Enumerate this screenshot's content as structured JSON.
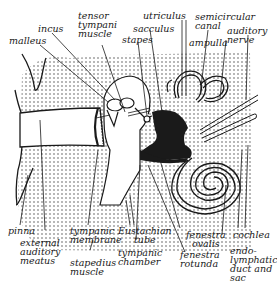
{
  "diagram": {
    "colors": {
      "ink": "#1a1a1a",
      "paper": "#ffffff",
      "stipple": "#3a3a3a"
    },
    "labels": {
      "malleus": "malleus",
      "incus": "incus",
      "tensor_tympani": "tensor\ntympani\nmuscle",
      "sacculus": "sacculus",
      "stapes": "stapes",
      "utriculus": "utriculus",
      "semicircular_canal": "semicircular\ncanal",
      "ampulla": "ampulla",
      "auditory_nerve": "auditory\nnerve",
      "pinna": "pinna",
      "external_auditory_meatus": "external\nauditory\nmeatus",
      "tympanic_membrane": "tympanic\nmembrane",
      "stapedius_muscle": "stapedius\nmuscle",
      "eustachian_tube": "Eustachian\ntube",
      "tympanic_chamber": "tympanic\nchamber",
      "fenestra_ovalis": "fenestra\novalis",
      "fenestra_rotunda": "fenestra\nrotunda",
      "cochlea": "cochlea",
      "endolymphatic_duct": "endo-\nlymphatic\nduct and\nsac"
    }
  }
}
